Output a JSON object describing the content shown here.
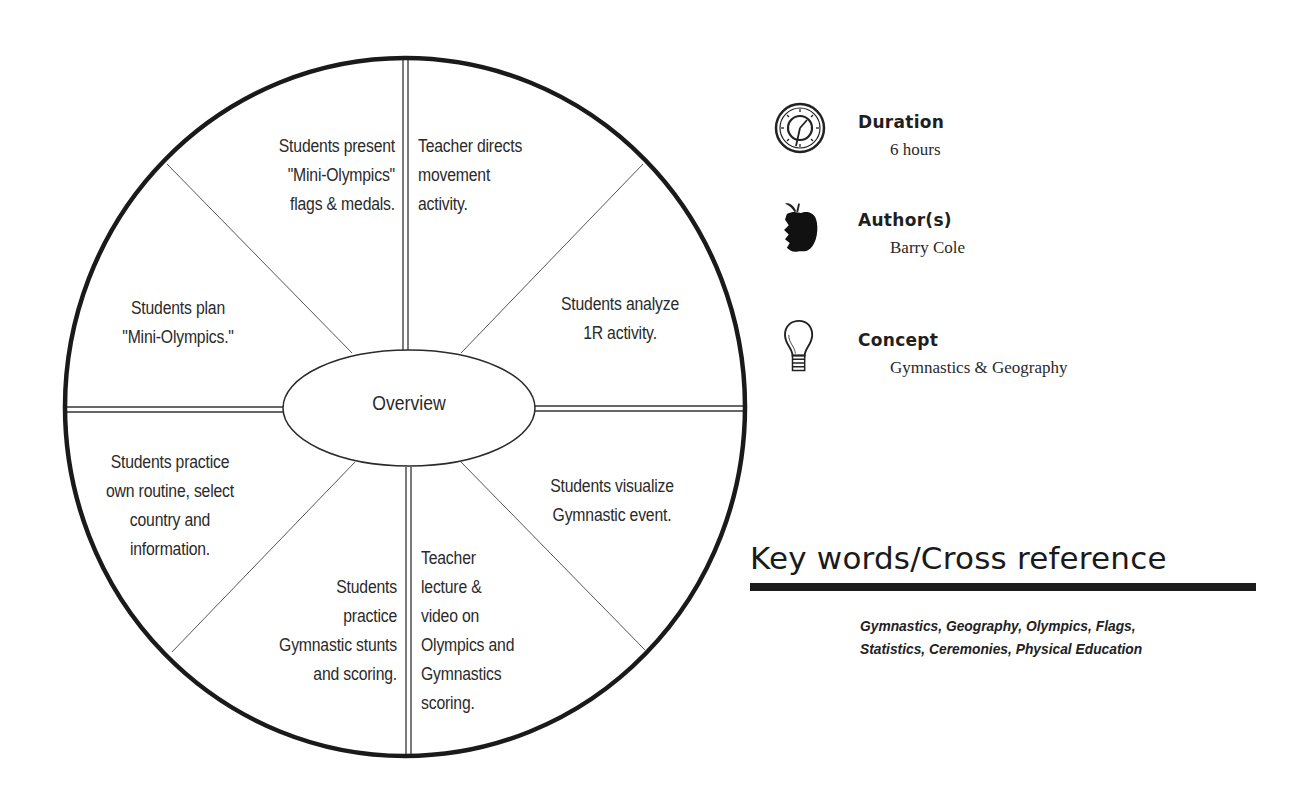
{
  "wheel": {
    "center_label": "Overview",
    "segments": [
      {
        "id": "top-left",
        "text": "Students present\n\"Mini-Olympics\"\nflags & medals."
      },
      {
        "id": "top-right",
        "text": "Teacher directs\nmovement\nactivity."
      },
      {
        "id": "right-upper",
        "text": "Students analyze\n1R activity."
      },
      {
        "id": "right-lower",
        "text": "Students visualize\nGymnastic event."
      },
      {
        "id": "bottom-right",
        "text": "Teacher\nlecture &\nvideo on\nOlympics and\nGymnastics\nscoring."
      },
      {
        "id": "bottom-left",
        "text": "Students\npractice\nGymnastic stunts\nand scoring."
      },
      {
        "id": "left-lower",
        "text": "Students practice\nown routine, select\ncountry and\ninformation."
      },
      {
        "id": "left-upper",
        "text": "Students plan\n\"Mini-Olympics.\""
      }
    ]
  },
  "info": {
    "duration": {
      "label": "Duration",
      "value": "6 hours",
      "icon": "clock-icon"
    },
    "authors": {
      "label": "Author(s)",
      "value": "Barry Cole",
      "icon": "apple-icon"
    },
    "concept": {
      "label": "Concept",
      "value": "Gymnastics & Geography",
      "icon": "lightbulb-icon"
    }
  },
  "keywords": {
    "title": "Key words/Cross reference",
    "line1": "Gymnastics, Geography, Olympics, Flags,",
    "line2": "Statistics, Ceremonies, Physical Education"
  }
}
